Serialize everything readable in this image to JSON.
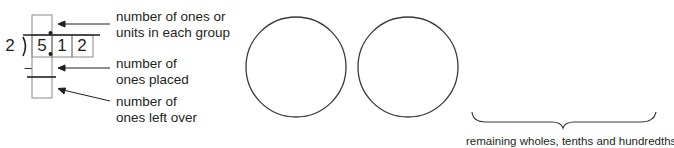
{
  "division_frame": {
    "divisor": "2",
    "dividend_digits": [
      "5",
      "1",
      "2"
    ],
    "minus_sign": "–"
  },
  "annotations": [
    {
      "line1": "number of ones or",
      "line2": "units in each group"
    },
    {
      "line1": "number of",
      "line2": "ones placed"
    },
    {
      "line1": "number of",
      "line2": "ones left over"
    }
  ],
  "circles": [
    {
      "label": ""
    },
    {
      "label": ""
    }
  ],
  "brace": {
    "label": "remaining wholes, tenths and hundredths"
  },
  "colors": {
    "ink": "#231f20",
    "grid": "#8a8a8a",
    "background": "#ffffff"
  }
}
